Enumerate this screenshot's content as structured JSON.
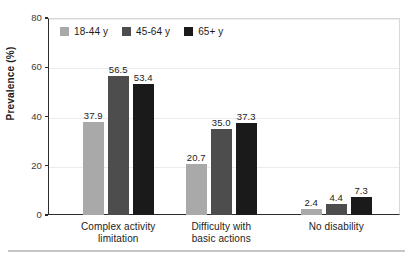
{
  "chart_data": {
    "type": "bar",
    "title": "",
    "subtitle": "",
    "xlabel": "",
    "ylabel": "Prevalence (%)",
    "ylim": [
      0,
      80
    ],
    "yticks": [
      "0",
      "20",
      "40",
      "60",
      "80"
    ],
    "grid": true,
    "legend_position": "top-left",
    "categories": [
      "Complex activity\nlimitation",
      "Difficulty with\nbasic actions",
      "No disability"
    ],
    "series": [
      {
        "name": "18-44 y",
        "color": "#a9a9a9",
        "values": [
          37.9,
          20.7,
          2.4
        ],
        "labels": [
          "37.9",
          "20.7",
          "2.4"
        ]
      },
      {
        "name": "45-64 y",
        "color": "#4d4d4d",
        "values": [
          56.5,
          35.0,
          4.4
        ],
        "labels": [
          "56.5",
          "35.0",
          "7.3"
        ]
      },
      {
        "name": "65+ y",
        "color": "#1a1a1a",
        "values": [
          53.4,
          37.3,
          7.3
        ],
        "labels": [
          "53.4",
          "37.3",
          "7.3"
        ]
      }
    ],
    "value_labels": [
      [
        "37.9",
        "56.5",
        "53.4"
      ],
      [
        "20.7",
        "35.0",
        "37.3"
      ],
      [
        "2.4",
        "4.4",
        "7.3"
      ]
    ],
    "axis_color": "#2b2b2b",
    "grid_color": "#ececec",
    "background": "#ffffff"
  }
}
